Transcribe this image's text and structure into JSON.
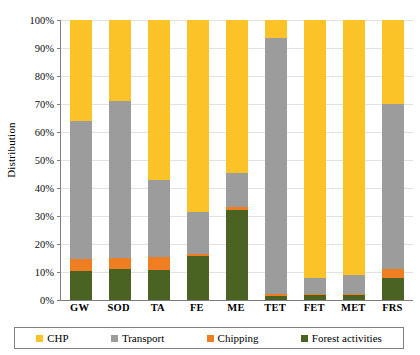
{
  "chart_data": {
    "type": "bar",
    "stacked": true,
    "title": "",
    "xlabel": "",
    "ylabel": "Distribution",
    "ylim": [
      0,
      100
    ],
    "ytick_labels": [
      "0%",
      "10%",
      "20%",
      "30%",
      "40%",
      "50%",
      "60%",
      "70%",
      "80%",
      "90%",
      "100%"
    ],
    "ytick_values": [
      0,
      10,
      20,
      30,
      40,
      50,
      60,
      70,
      80,
      90,
      100
    ],
    "grid": true,
    "legend_position": "bottom",
    "categories": [
      "GW",
      "SOD",
      "TA",
      "FE",
      "ME",
      "TET",
      "FET",
      "MET",
      "FRS"
    ],
    "series": [
      {
        "name": "Forest activities",
        "color": "#4a6323",
        "values": [
          10.5,
          11.0,
          10.8,
          15.8,
          32.3,
          1.5,
          1.8,
          1.8,
          8.0
        ]
      },
      {
        "name": "Chipping",
        "color": "#ef7d22",
        "values": [
          4.2,
          4.0,
          4.6,
          0.5,
          0.8,
          0.6,
          0.3,
          0.3,
          3.2
        ]
      },
      {
        "name": "Transport",
        "color": "#9c9c9c",
        "values": [
          49.3,
          56.0,
          27.6,
          15.2,
          12.4,
          91.4,
          5.8,
          6.9,
          58.8
        ]
      },
      {
        "name": "CHP",
        "color": "#fcc328",
        "values": [
          36.0,
          29.0,
          57.0,
          68.5,
          54.5,
          6.5,
          92.1,
          91.0,
          30.0
        ]
      }
    ]
  },
  "legend": {
    "items": [
      {
        "label": "CHP",
        "color": "#fcc328"
      },
      {
        "label": "Transport",
        "color": "#9c9c9c"
      },
      {
        "label": "Chipping",
        "color": "#ef7d22"
      },
      {
        "label": "Forest activities",
        "color": "#4a6323"
      }
    ]
  }
}
